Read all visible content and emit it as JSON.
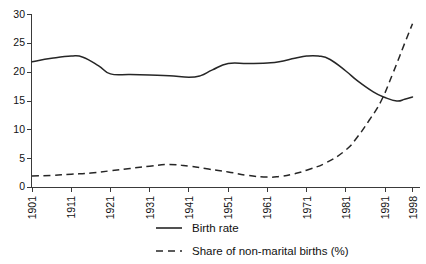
{
  "chart_data": {
    "type": "line",
    "title": "",
    "subtitle": "",
    "xlabel": "",
    "ylabel": "",
    "xlim": [
      1901,
      1998
    ],
    "ylim": [
      0,
      30
    ],
    "grid": false,
    "legend_position": "bottom-center",
    "y_ticks": [
      0,
      5,
      10,
      15,
      20,
      25,
      30
    ],
    "y_tick_labels": [
      "0",
      "5",
      "10",
      "15",
      "20",
      "25",
      "30"
    ],
    "x_ticks": [
      1901,
      1911,
      1921,
      1931,
      1941,
      1951,
      1961,
      1971,
      1981,
      1991,
      1998
    ],
    "x_tick_labels": [
      "1901",
      "1911",
      "1921",
      "1931",
      "1941",
      "1951",
      "1961",
      "1971",
      "1981",
      "1991",
      "1998"
    ],
    "series": [
      {
        "name": "Birth rate",
        "style": "solid",
        "color": "#262626",
        "x": [
          1901,
          1906,
          1911,
          1914,
          1918,
          1921,
          1926,
          1931,
          1936,
          1941,
          1944,
          1947,
          1951,
          1956,
          1961,
          1964,
          1968,
          1971,
          1974,
          1977,
          1981,
          1984,
          1988,
          1991,
          1994,
          1996,
          1998
        ],
        "values": [
          21.8,
          22.4,
          22.8,
          22.6,
          21.1,
          19.7,
          19.6,
          19.5,
          19.4,
          19.1,
          19.4,
          20.4,
          21.5,
          21.5,
          21.6,
          21.8,
          22.4,
          22.8,
          22.8,
          22.2,
          20.2,
          18.5,
          16.6,
          15.6,
          15.0,
          15.3,
          15.7
        ],
        "endpoint_value": 15.7
      },
      {
        "name": "Share of non-marital births (%)",
        "style": "dashed",
        "color": "#262626",
        "x": [
          1901,
          1906,
          1911,
          1916,
          1921,
          1926,
          1931,
          1936,
          1941,
          1946,
          1951,
          1956,
          1961,
          1964,
          1968,
          1971,
          1976,
          1981,
          1984,
          1987,
          1990,
          1993,
          1996,
          1998
        ],
        "values": [
          2.0,
          2.1,
          2.3,
          2.5,
          2.9,
          3.3,
          3.7,
          4.0,
          3.7,
          3.2,
          2.7,
          2.1,
          1.8,
          1.9,
          2.4,
          3.0,
          4.3,
          6.5,
          8.8,
          11.7,
          15.0,
          19.8,
          25.0,
          28.4
        ],
        "endpoint_value": 28.4
      }
    ],
    "legend": [
      {
        "label": "Birth rate",
        "style": "solid"
      },
      {
        "label": "Share of non-marital births (%)",
        "style": "dashed"
      }
    ]
  }
}
